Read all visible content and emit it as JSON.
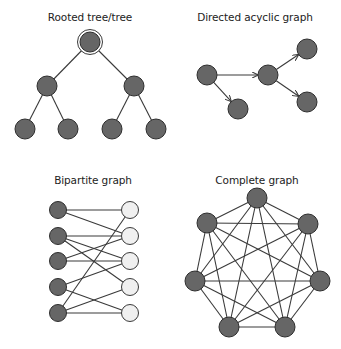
{
  "panels": {
    "tree": {
      "title": "Rooted tree/tree",
      "nodes": [
        {
          "id": "root",
          "x": 90,
          "y": 42,
          "root": true
        },
        {
          "id": "a",
          "x": 47,
          "y": 86
        },
        {
          "id": "b",
          "x": 134,
          "y": 86
        },
        {
          "id": "c",
          "x": 25,
          "y": 129
        },
        {
          "id": "d",
          "x": 68,
          "y": 129
        },
        {
          "id": "e",
          "x": 112,
          "y": 129
        },
        {
          "id": "f",
          "x": 156,
          "y": 129
        }
      ],
      "edges": [
        [
          "root",
          "a"
        ],
        [
          "root",
          "b"
        ],
        [
          "a",
          "c"
        ],
        [
          "a",
          "d"
        ],
        [
          "b",
          "e"
        ],
        [
          "b",
          "f"
        ]
      ]
    },
    "dag": {
      "title": "Directed acyclic graph",
      "nodes": [
        {
          "id": "A",
          "x": 207,
          "y": 75
        },
        {
          "id": "B",
          "x": 268,
          "y": 75
        },
        {
          "id": "C",
          "x": 307,
          "y": 49
        },
        {
          "id": "D",
          "x": 307,
          "y": 102
        },
        {
          "id": "E",
          "x": 238,
          "y": 109
        }
      ],
      "edges": [
        [
          "A",
          "B"
        ],
        [
          "A",
          "E"
        ],
        [
          "B",
          "C"
        ],
        [
          "B",
          "D"
        ]
      ]
    },
    "bipartite": {
      "title": "Bipartite graph",
      "left": [
        {
          "id": "L1",
          "x": 58,
          "y": 210
        },
        {
          "id": "L2",
          "x": 58,
          "y": 236
        },
        {
          "id": "L3",
          "x": 58,
          "y": 261
        },
        {
          "id": "L4",
          "x": 58,
          "y": 287
        },
        {
          "id": "L5",
          "x": 58,
          "y": 313
        }
      ],
      "right": [
        {
          "id": "R1",
          "x": 130,
          "y": 210
        },
        {
          "id": "R2",
          "x": 130,
          "y": 236
        },
        {
          "id": "R3",
          "x": 130,
          "y": 261
        },
        {
          "id": "R4",
          "x": 130,
          "y": 287
        },
        {
          "id": "R5",
          "x": 130,
          "y": 313
        }
      ],
      "edges": [
        [
          "L1",
          "R1"
        ],
        [
          "L1",
          "R2"
        ],
        [
          "L2",
          "R2"
        ],
        [
          "L2",
          "R3"
        ],
        [
          "L2",
          "R4"
        ],
        [
          "L3",
          "R2"
        ],
        [
          "L3",
          "R3"
        ],
        [
          "L4",
          "R3"
        ],
        [
          "L4",
          "R5"
        ],
        [
          "L5",
          "R1"
        ],
        [
          "L5",
          "R4"
        ],
        [
          "L5",
          "R5"
        ]
      ]
    },
    "complete": {
      "title": "Complete graph",
      "nodes": [
        {
          "id": "K1",
          "x": 257,
          "y": 198
        },
        {
          "id": "K2",
          "x": 308,
          "y": 224
        },
        {
          "id": "K3",
          "x": 320,
          "y": 281
        },
        {
          "id": "K4",
          "x": 285,
          "y": 327
        },
        {
          "id": "K5",
          "x": 229,
          "y": 327
        },
        {
          "id": "K6",
          "x": 195,
          "y": 281
        },
        {
          "id": "K7",
          "x": 207,
          "y": 223
        }
      ]
    }
  },
  "colors": {
    "node_fill": "#666666",
    "node_light_fill": "#f0f0f0",
    "edge": "#3a3a3a"
  }
}
